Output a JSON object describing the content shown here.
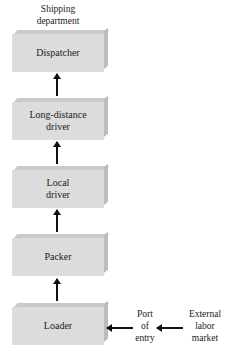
{
  "header": {
    "line1": "Shipping",
    "line2": "department"
  },
  "boxes": [
    {
      "line1": "Dispatcher",
      "line2": ""
    },
    {
      "line1": "Long-distance",
      "line2": "driver"
    },
    {
      "line1": "Local",
      "line2": "driver"
    },
    {
      "line1": "Packer",
      "line2": ""
    },
    {
      "line1": "Loader",
      "line2": ""
    }
  ],
  "port": {
    "line1": "Port",
    "line2": "of",
    "line3": "entry"
  },
  "external": {
    "line1": "External",
    "line2": "labor",
    "line3": "market"
  }
}
